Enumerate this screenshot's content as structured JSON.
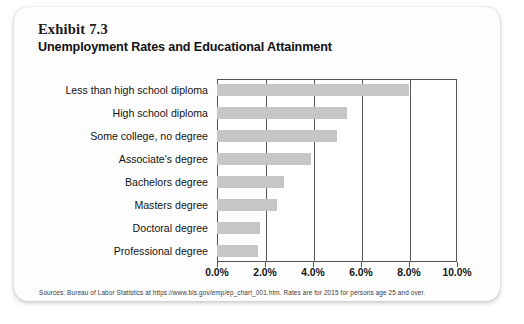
{
  "card": {
    "exhibit_label": "Exhibit 7.3",
    "title": "Unemployment Rates and Educational Attainment",
    "source_note": "Sources: Bureau of Labor Statistics at https://www.bls.gov/emp/ep_chart_001.htm. Rates are for 2015 for persons age 25 and over."
  },
  "chart_data": {
    "type": "bar",
    "orientation": "horizontal",
    "title": "Unemployment Rates and Educational Attainment",
    "subtitle": "Exhibit 7.3",
    "xlabel": "",
    "ylabel": "",
    "categories": [
      "Less than high school diploma",
      "High school diploma",
      "Some college, no degree",
      "Associate's degree",
      "Bachelors degree",
      "Masters degree",
      "Doctoral degree",
      "Professional degree"
    ],
    "values": [
      8.0,
      5.4,
      5.0,
      3.9,
      2.8,
      2.5,
      1.8,
      1.7
    ],
    "value_unit": "%",
    "xlim": [
      0,
      10
    ],
    "xticks": [
      0,
      2,
      4,
      6,
      8,
      10
    ],
    "xticklabels": [
      "0.0%",
      "2.0%",
      "4.0%",
      "6.0%",
      "8.0%",
      "10.0%"
    ],
    "grid": "vertical",
    "legend": "none",
    "bar_color": "#c6c6c6",
    "axis_color": "#555555"
  }
}
